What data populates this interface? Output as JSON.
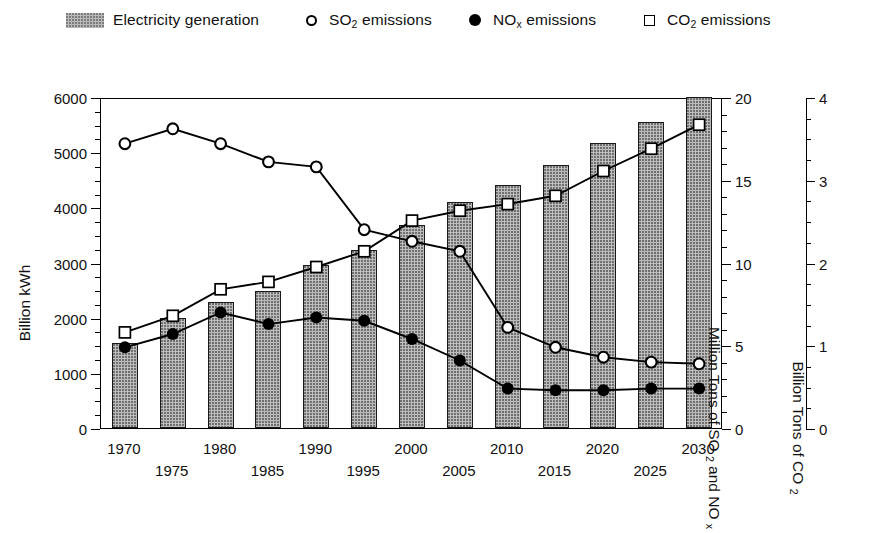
{
  "legend": {
    "items": [
      {
        "icon": "bar-swatch",
        "label": "Electricity generation",
        "sub": ""
      },
      {
        "icon": "circle-open-icon",
        "label": "SO",
        "sub": "2",
        "tail": " emissions"
      },
      {
        "icon": "circle-filled-icon",
        "label": "NO",
        "sub": "x",
        "tail": " emissions"
      },
      {
        "icon": "square-open-icon",
        "label": "CO",
        "sub": "2",
        "tail": " emissions"
      }
    ]
  },
  "axes": {
    "left": {
      "title": "Billion kWh",
      "min": 0,
      "max": 6000,
      "step": 1000,
      "minor_step": 250,
      "ticks": [
        "0",
        "1000",
        "2000",
        "3000",
        "4000",
        "5000",
        "6000"
      ]
    },
    "right1": {
      "title_parts": [
        "Million Tons of SO ",
        "2",
        " and NO ",
        "x"
      ],
      "title": "Million Tons of SO 2 and NO x",
      "min": 0,
      "max": 20,
      "step": 5,
      "minor_step": 1,
      "ticks": [
        "0",
        "5",
        "10",
        "15",
        "20"
      ]
    },
    "right2": {
      "title_parts": [
        "Billion Tons of CO ",
        "2"
      ],
      "title": "Billion Tons of CO 2",
      "min": 0,
      "max": 4,
      "step": 1,
      "minor_step": 0.25,
      "ticks": [
        "0",
        "1",
        "2",
        "3",
        "4"
      ]
    },
    "x": {
      "labels": [
        "1970",
        "1975",
        "1980",
        "1985",
        "1990",
        "1995",
        "2000",
        "2005",
        "2010",
        "2015",
        "2020",
        "2025",
        "2030"
      ]
    }
  },
  "chart_data": {
    "type": "bar",
    "title": "",
    "xlabel": "",
    "ylabel": "Billion kWh",
    "grid": false,
    "legend_position": "top",
    "categories": [
      "1970",
      "1975",
      "1980",
      "1985",
      "1990",
      "1995",
      "2000",
      "2005",
      "2010",
      "2015",
      "2020",
      "2025",
      "2030"
    ],
    "axis_ranges": {
      "left_kwh": [
        0,
        6000
      ],
      "right_so2_nox": [
        0,
        20
      ],
      "right_co2": [
        0,
        4
      ]
    },
    "series": [
      {
        "name": "Electricity generation",
        "type": "bar",
        "axis": "left_kwh",
        "unit": "Billion kWh",
        "values": [
          1550,
          2000,
          2290,
          2480,
          2950,
          3230,
          3680,
          4100,
          4400,
          4760,
          5160,
          5540,
          6000
        ]
      },
      {
        "name": "SO2 emissions",
        "type": "line",
        "marker": "circle-open",
        "axis": "right_so2_nox",
        "unit": "Million Tons",
        "values": [
          17.3,
          18.2,
          17.3,
          16.2,
          15.9,
          12.1,
          11.4,
          10.8,
          6.2,
          5.0,
          4.4,
          4.1,
          4.0
        ]
      },
      {
        "name": "NOx emissions",
        "type": "line",
        "marker": "circle-filled",
        "axis": "right_so2_nox",
        "unit": "Million Tons",
        "values": [
          5.0,
          5.8,
          7.1,
          6.4,
          6.8,
          6.6,
          5.5,
          4.2,
          2.5,
          2.4,
          2.4,
          2.5,
          2.5
        ]
      },
      {
        "name": "CO2 emissions",
        "type": "line",
        "marker": "square-open",
        "axis": "right_co2",
        "unit": "Billion Tons",
        "values": [
          1.18,
          1.38,
          1.7,
          1.79,
          1.97,
          2.16,
          2.53,
          2.65,
          2.73,
          2.83,
          3.13,
          3.4,
          3.69
        ]
      }
    ]
  },
  "style": {
    "bar_fill": "#bdbdbd",
    "bar_edge": "#1a1a1a",
    "line_color": "#000000",
    "background": "#ffffff"
  }
}
